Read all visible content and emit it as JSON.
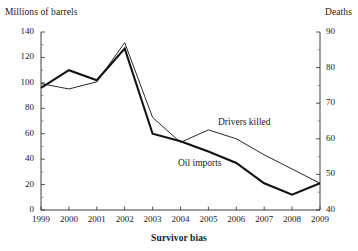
{
  "chart_data": {
    "type": "line",
    "title": "",
    "xlabel": "Survivor bias",
    "ylabel": "Millions of barrels",
    "y2label": "Deaths",
    "categories": [
      "1999",
      "2000",
      "2001",
      "2002",
      "2003",
      "2004",
      "2005",
      "2006",
      "2007",
      "2008",
      "2009"
    ],
    "x": [
      1999,
      2000,
      2001,
      2002,
      2003,
      2004,
      2005,
      2006,
      2007,
      2008,
      2009
    ],
    "ylim": [
      0,
      140
    ],
    "y2lim": [
      40,
      90
    ],
    "yticks": [
      0,
      20,
      40,
      60,
      80,
      100,
      120,
      140
    ],
    "y2ticks": [
      40,
      50,
      60,
      70,
      80,
      90
    ],
    "grid": false,
    "legend_position": "inline-annotations",
    "series": [
      {
        "name": "Oil imports",
        "axis": "left",
        "units": "Millions of barrels",
        "style": "thick",
        "values": [
          96,
          110,
          102,
          127,
          60,
          54,
          46,
          37,
          21,
          12,
          21
        ]
      },
      {
        "name": "Drivers killed",
        "axis": "right",
        "units": "Deaths",
        "style": "thin",
        "values": [
          75.5,
          74,
          76,
          87,
          66,
          59,
          62.5,
          60,
          55.5,
          51.5,
          47.5
        ]
      }
    ],
    "annotations": [
      {
        "text": "Drivers killed",
        "series": "Drivers killed"
      },
      {
        "text": "Oil imports",
        "series": "Oil imports"
      }
    ],
    "colors": {
      "line": "#111111",
      "axis": "#2b2b2b",
      "background": "#ffffff"
    }
  },
  "axes": {
    "left_title": "Millions of barrels",
    "right_title": "Deaths",
    "bottom_title": "Survivor bias",
    "left_ticks": [
      "140",
      "120",
      "100",
      "80",
      "60",
      "40",
      "20",
      "0"
    ],
    "right_ticks": [
      "90",
      "80",
      "70",
      "60",
      "50",
      "40"
    ],
    "bottom_ticks": [
      "1999",
      "2000",
      "2001",
      "2002",
      "2003",
      "2004",
      "2005",
      "2006",
      "2007",
      "2008",
      "2009"
    ]
  },
  "series_labels": {
    "drivers_killed": "Drivers killed",
    "oil_imports": "Oil imports"
  }
}
